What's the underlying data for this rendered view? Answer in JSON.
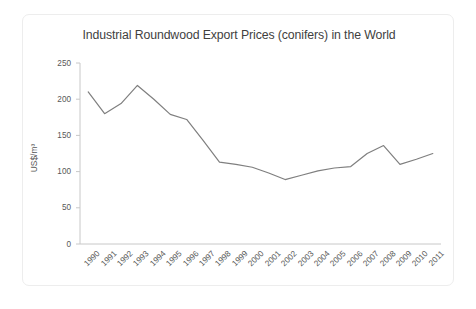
{
  "chart_data": {
    "type": "line",
    "title": "Industrial Roundwood Export Prices (conifers) in the World",
    "xlabel": "",
    "ylabel": "US$/m³",
    "ylim": [
      0,
      250
    ],
    "yticks": [
      0,
      50,
      100,
      150,
      200,
      250
    ],
    "ytick_labels": [
      "0",
      "50",
      "100",
      "150",
      "200",
      "250"
    ],
    "grid": false,
    "legend": false,
    "legend_position": "none",
    "line_color": "#7f7f7f",
    "markers": false,
    "categories": [
      "1990",
      "1991",
      "1992",
      "1993",
      "1994",
      "1995",
      "1996",
      "1997",
      "1998",
      "1999",
      "2000",
      "2001",
      "2002",
      "2003",
      "2004",
      "2005",
      "2006",
      "2007",
      "2008",
      "2009",
      "2010",
      "2011"
    ],
    "x": [
      1990,
      1991,
      1992,
      1993,
      1994,
      1995,
      1996,
      1997,
      1998,
      1999,
      2000,
      2001,
      2002,
      2003,
      2004,
      2005,
      2006,
      2007,
      2008,
      2009,
      2010,
      2011
    ],
    "values": [
      210,
      180,
      194,
      219,
      200,
      179,
      172,
      143,
      113,
      110,
      106,
      98,
      89,
      95,
      101,
      105,
      107,
      125,
      136,
      110,
      117,
      125
    ],
    "series": [
      {
        "name": "Industrial Roundwood Export Price (conifers)",
        "values": [
          210,
          180,
          194,
          219,
          200,
          179,
          172,
          143,
          113,
          110,
          106,
          98,
          89,
          95,
          101,
          105,
          107,
          125,
          136,
          110,
          117,
          125
        ]
      }
    ]
  },
  "colors": {
    "line": "#7f7f7f",
    "axis": "#c8c8c8",
    "text": "#585858",
    "title_text": "#3f3f3f",
    "frame_border": "#ededed",
    "background": "#ffffff"
  }
}
